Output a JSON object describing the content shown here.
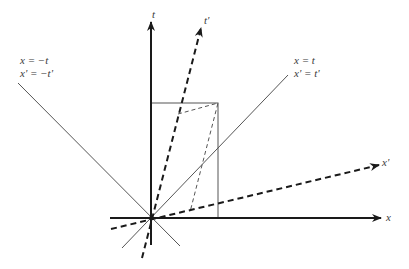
{
  "diagram": {
    "axes": {
      "t": {
        "label": "t"
      },
      "t_prime": {
        "label": "t'"
      },
      "x": {
        "label": "x"
      },
      "x_prime": {
        "label": "x'"
      }
    },
    "light_lines": {
      "right": {
        "line1": "x = t",
        "line2": "x' = t'"
      },
      "left": {
        "line1": "x = −t",
        "line2": "x' = −t'"
      }
    },
    "colors": {
      "axis": "#1a1a1a",
      "thin_line": "#555555",
      "text": "#3a3a3a"
    }
  }
}
